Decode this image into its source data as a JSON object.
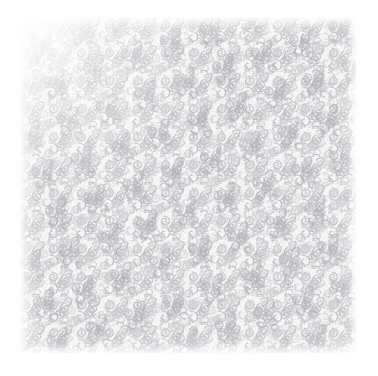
{
  "image": {
    "kind": "decorative-texture-swatch",
    "subject": "seamless scrolling-vine filigree pattern",
    "alt_text": "Dense allover pattern of small light-grey spirals and C-scrolls printed on white paper",
    "canvas_width": 378,
    "canvas_height": 376,
    "background_color": "#ffffff"
  },
  "swatch": {
    "left": 20,
    "top": 17,
    "width": 336,
    "height": 336,
    "paper_color": "#ffffff",
    "ink_color_light": "#d6d6da",
    "ink_color_mid": "#c2c2c8",
    "ink_color_dark": "#aeaeb6",
    "motif_name": "spiral-scroll",
    "motif_diameter_px": 10,
    "tile_size_px": 28,
    "stroke_width_px": 1.15,
    "edge_treatment": "soft white fade at all four borders, strongest at top-left corner"
  },
  "overlays": {
    "vignette_name": "edge-fade",
    "grain_name": "paper-grain",
    "grain_opacity": 0.3
  },
  "text_content": {
    "has_text": "false",
    "labels": []
  }
}
